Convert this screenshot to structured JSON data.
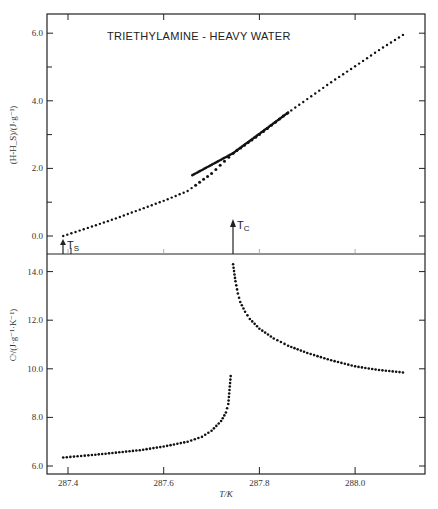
{
  "chart_data": [
    {
      "type": "scatter",
      "panel": "upper",
      "title": "TRIETHYLAMINE - HEAVY WATER",
      "xlabel": "T/K",
      "ylabel": "(H-H_S)/(J·g⁻¹)",
      "xlim": [
        287.38,
        288.13
      ],
      "ylim": [
        -0.55,
        6.55
      ],
      "yticks": [
        0.0,
        2.0,
        4.0,
        6.0
      ],
      "ytick_labels": [
        "0.0",
        "2.0",
        "4.0",
        "6.0"
      ],
      "yminor": [
        1.0,
        3.0,
        5.0
      ],
      "grid": false,
      "annotations": [
        {
          "text": "T_S",
          "x": 287.39,
          "kind": "arrow"
        },
        {
          "text": "T_C",
          "x": 287.745,
          "kind": "arrow"
        }
      ],
      "series": [
        {
          "name": "enthalpy",
          "x": [
            287.39,
            287.45,
            287.5,
            287.55,
            287.6,
            287.65,
            287.7,
            287.745,
            287.8,
            287.85,
            287.9,
            287.95,
            288.0,
            288.05,
            288.1
          ],
          "values": [
            0.0,
            0.28,
            0.52,
            0.78,
            1.04,
            1.33,
            1.85,
            2.45,
            3.0,
            3.55,
            4.05,
            4.55,
            5.02,
            5.5,
            5.95
          ]
        }
      ]
    },
    {
      "type": "scatter",
      "panel": "lower",
      "title": "",
      "xlabel": "T/K",
      "ylabel": "Cˢ/(J·g⁻¹·K⁻¹)",
      "xlim": [
        287.38,
        288.13
      ],
      "ylim": [
        5.7,
        14.8
      ],
      "xticks": [
        287.4,
        287.6,
        287.8,
        288.0
      ],
      "xtick_labels": [
        "287.4",
        "287.6",
        "287.8",
        "288.0"
      ],
      "yticks": [
        6.0,
        8.0,
        10.0,
        12.0,
        14.0
      ],
      "ytick_labels": [
        "6.0",
        "8.0",
        "10.0",
        "12.0",
        "14.0"
      ],
      "grid": false,
      "series": [
        {
          "name": "below T_C",
          "x": [
            287.39,
            287.45,
            287.5,
            287.55,
            287.6,
            287.65,
            287.68,
            287.7,
            287.72,
            287.73,
            287.735,
            287.74
          ],
          "values": [
            6.35,
            6.45,
            6.55,
            6.65,
            6.8,
            7.0,
            7.2,
            7.45,
            7.85,
            8.2,
            8.55,
            9.7
          ]
        },
        {
          "name": "above T_C",
          "x": [
            287.745,
            287.75,
            287.755,
            287.76,
            287.77,
            287.78,
            287.8,
            287.83,
            287.86,
            287.9,
            287.95,
            288.0,
            288.05,
            288.1
          ],
          "values": [
            14.3,
            13.6,
            13.1,
            12.75,
            12.35,
            12.05,
            11.65,
            11.25,
            10.95,
            10.65,
            10.35,
            10.1,
            9.95,
            9.85
          ]
        }
      ]
    }
  ]
}
